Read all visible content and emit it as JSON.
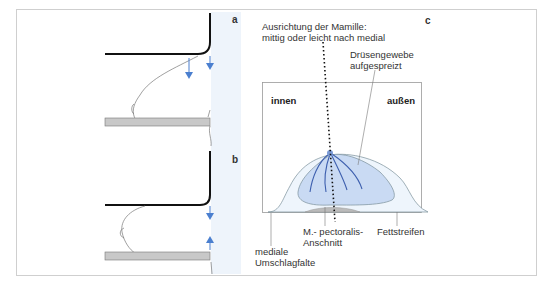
{
  "figure": {
    "panels": [
      {
        "id": "a",
        "label": "a",
        "description": "Compression plates, breast sagging with arrows pointing downward"
      },
      {
        "id": "b",
        "label": "b",
        "description": "Compression plates, breast compressed with arrows toward each other"
      },
      {
        "id": "c",
        "label": "c",
        "description": "Cross-section of compressed breast"
      }
    ],
    "panel_c": {
      "nipple_alignment": "Ausrichtung der Mamille:",
      "nipple_alignment_2": "mittig oder leicht nach medial",
      "glandular_1": "Drüsengewebe",
      "glandular_2": "aufgespreizt",
      "inner": "innen",
      "outer": "außen",
      "pectoralis_1": "M.- pectoralis-",
      "pectoralis_2": "Anschnitt",
      "fat": "Fettstreifen",
      "fold_1": "mediale",
      "fold_2": "Umschlagfalte"
    },
    "colors": {
      "arrow": "#4a7fcf",
      "tissue": "#c9daf3",
      "band": "#eef4fb",
      "plate": "#c8c8c8",
      "duct": "#3d5fae"
    }
  }
}
